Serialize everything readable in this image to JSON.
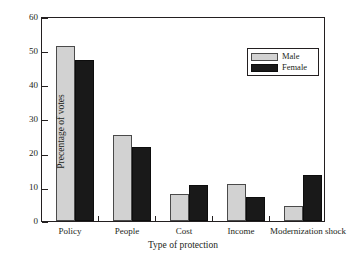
{
  "chart_data": {
    "type": "bar",
    "title": "",
    "subtitle": "",
    "xlabel": "Type of protection",
    "ylabel": "Precentage of votes",
    "categories": [
      "Policy",
      "People",
      "Cost",
      "Income",
      "Modernization shock"
    ],
    "series": [
      {
        "name": "Male",
        "color": "#d2d2d2",
        "values": [
          51.5,
          25.3,
          8.1,
          11.0,
          4.5
        ]
      },
      {
        "name": "Female",
        "color": "#191919",
        "values": [
          47.5,
          21.8,
          10.5,
          7.0,
          13.5
        ]
      }
    ],
    "ylim": [
      0,
      60
    ],
    "yticks": [
      0,
      10,
      20,
      30,
      40,
      50,
      60
    ],
    "ytick_labels": [
      "0",
      "10",
      "20",
      "30",
      "40",
      "50",
      "60"
    ],
    "grid": false,
    "legend_position": "upper right",
    "legend_entries": [
      "Male",
      "Female"
    ]
  },
  "axes": {
    "y_tick_0": "0",
    "y_tick_1": "10",
    "y_tick_2": "20",
    "y_tick_3": "30",
    "y_tick_4": "40",
    "y_tick_5": "50",
    "y_tick_6": "60",
    "x_label_0": "Policy",
    "x_label_1": "People",
    "x_label_2": "Cost",
    "x_label_3": "Income",
    "x_label_4": "Modernization shock",
    "x_title": "Type of protection",
    "y_title": "Precentage of votes"
  },
  "legend": {
    "male_label": "Male",
    "female_label": "Female"
  }
}
